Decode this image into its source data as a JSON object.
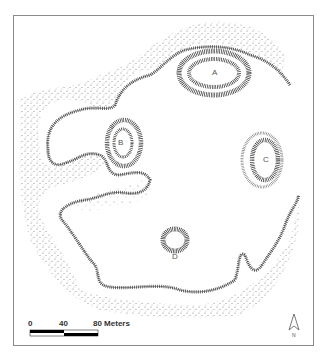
{
  "map": {
    "type": "archaeological site plan",
    "mounds": [
      {
        "id": "A",
        "label": "A",
        "x": 214,
        "y": 73
      },
      {
        "id": "B",
        "label": "B",
        "x": 121,
        "y": 143
      },
      {
        "id": "C",
        "label": "C",
        "x": 265,
        "y": 160
      },
      {
        "id": "D",
        "label": "D",
        "x": 175,
        "y": 256
      }
    ],
    "colors": {
      "hachure": "#3a3a3a",
      "stipple": "#6a6a6a",
      "frame": "#8a8a8a",
      "background": "#ffffff"
    }
  },
  "scale_bar": {
    "ticks": [
      "0",
      "40",
      "80"
    ],
    "unit": "Meters",
    "label_80": "80 Meters"
  },
  "north_arrow": {
    "label": "N"
  }
}
